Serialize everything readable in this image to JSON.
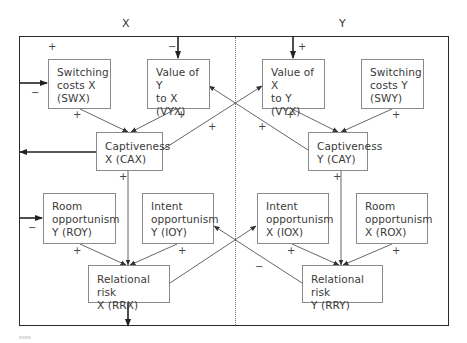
{
  "columns": [
    {
      "id": "x",
      "label": "X"
    },
    {
      "id": "y",
      "label": "Y"
    }
  ],
  "nodes": [
    {
      "id": "SWX",
      "label": "Switching\ncosts X\n(SWX)"
    },
    {
      "id": "VYX",
      "label": "Value of Y\nto X\n(VYX)"
    },
    {
      "id": "VXY",
      "label": "Value of X\nto Y\n(VYX)"
    },
    {
      "id": "SWY",
      "label": "Switching\ncosts Y\n(SWY)"
    },
    {
      "id": "CAX",
      "label": "Captiveness\nX (CAX)"
    },
    {
      "id": "CAY",
      "label": "Captiveness\nY (CAY)"
    },
    {
      "id": "ROY",
      "label": "Room\nopportunism\nY (ROY)"
    },
    {
      "id": "IOY",
      "label": "Intent\nopportunism\nY (IOY)"
    },
    {
      "id": "IOX",
      "label": "Intent\nopportunism\nX (IOX)"
    },
    {
      "id": "ROX",
      "label": "Room\nopportunism\nX (ROX)"
    },
    {
      "id": "RRX",
      "label": "Relational risk\nX (RRX)"
    },
    {
      "id": "RRY",
      "label": "Relational risk\nY (RRY)"
    }
  ],
  "signs": {
    "swx_in_top": "+",
    "swx_in_left": "−",
    "vyx_in": "−",
    "vxy_in": "+",
    "swx_to_cax": "+",
    "vyx_to_cax": "+",
    "vxy_to_cay": "+",
    "swy_to_cay": "+",
    "cax_to_vxy": "+",
    "cay_to_vyx": "+",
    "cax_down": "+",
    "cay_down": "+",
    "roy_in": "−",
    "roy_to_rrx": "+",
    "ioy_to_rrx": "+",
    "iox_to_rry": "+",
    "rox_to_rry": "+",
    "rry_to_ioy": "−"
  },
  "edges": [
    {
      "from": "frame",
      "to": "SWX",
      "sign": "−"
    },
    {
      "from": "frame",
      "to": "VYX",
      "sign": "−"
    },
    {
      "from": "frame",
      "to": "VXY",
      "sign": "+"
    },
    {
      "from": "SWX",
      "to": "CAX",
      "sign": "+"
    },
    {
      "from": "VYX",
      "to": "CAX",
      "sign": "+"
    },
    {
      "from": "VXY",
      "to": "CAY",
      "sign": "+"
    },
    {
      "from": "SWY",
      "to": "CAY",
      "sign": "+"
    },
    {
      "from": "CAX",
      "to": "VXY",
      "sign": "+"
    },
    {
      "from": "CAY",
      "to": "VYX",
      "sign": "+"
    },
    {
      "from": "CAX",
      "to": "frame",
      "sign": ""
    },
    {
      "from": "CAX",
      "to": "RRX",
      "sign": "+"
    },
    {
      "from": "CAY",
      "to": "RRY",
      "sign": "+"
    },
    {
      "from": "frame",
      "to": "ROY",
      "sign": "−"
    },
    {
      "from": "ROY",
      "to": "RRX",
      "sign": "+"
    },
    {
      "from": "IOY",
      "to": "RRX",
      "sign": "+"
    },
    {
      "from": "IOX",
      "to": "RRY",
      "sign": "+"
    },
    {
      "from": "ROX",
      "to": "RRY",
      "sign": "+"
    },
    {
      "from": "RRX",
      "to": "IOX",
      "sign": ""
    },
    {
      "from": "RRY",
      "to": "IOY",
      "sign": "−"
    },
    {
      "from": "RRX",
      "to": "exit",
      "sign": ""
    }
  ]
}
